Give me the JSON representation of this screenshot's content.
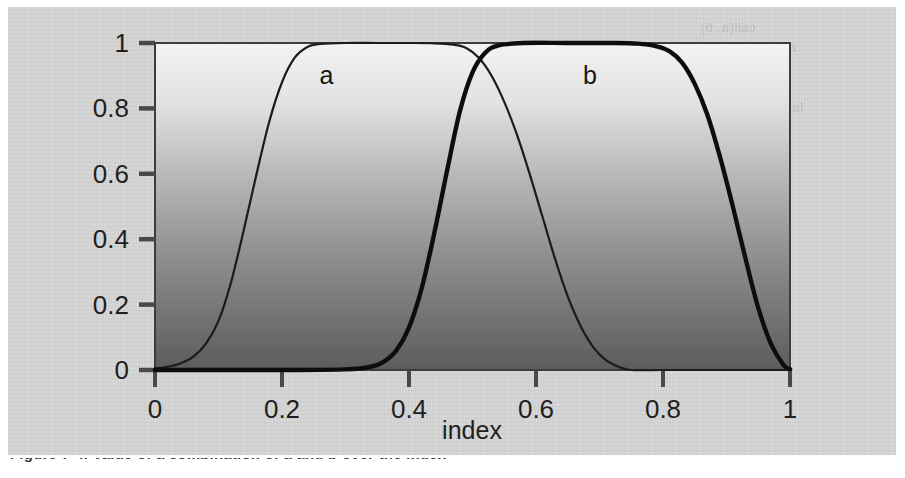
{
  "figure": {
    "caption": "Figure 7-4. Value of a combination of a and b over the index",
    "panel_background": "#d2d2d2",
    "page_background": "#ffffff"
  },
  "bleed_text": [
    {
      "text": "call(a, b)",
      "x": 700,
      "y": 20
    },
    {
      "text": "call(a, b, c) + f.p.  ind.",
      "x": 660,
      "y": 40
    },
    {
      "text": "func 4.2.5  ->  index  11.2.3.4",
      "x": 630,
      "y": 100
    },
    {
      "text": "f. 1 0.0",
      "x": 700,
      "y": 215
    },
    {
      "text": "def(a, b)",
      "x": 690,
      "y": 240
    },
    {
      "text": "for (v) { node ) C",
      "x": 650,
      "y": 300
    }
  ],
  "chart_data": {
    "type": "line",
    "title": "",
    "xlabel": "index",
    "ylabel": "",
    "xlim": [
      0,
      1
    ],
    "ylim": [
      0,
      1
    ],
    "grid": false,
    "legend_position": "inline-annotation",
    "xticks": [
      "0",
      "0.2",
      "0.4",
      "0.6",
      "0.8",
      "1"
    ],
    "xtick_values": [
      0,
      0.2,
      0.4,
      0.6,
      0.8,
      1
    ],
    "yticks": [
      "0",
      "0.2",
      "0.4",
      "0.6",
      "0.8",
      "1"
    ],
    "ytick_values": [
      0,
      0.2,
      0.4,
      0.6,
      0.8,
      1
    ],
    "annotations": [
      {
        "label": "a",
        "x": 0.27,
        "y": 0.9
      },
      {
        "label": "b",
        "x": 0.685,
        "y": 0.9
      }
    ],
    "series": [
      {
        "name": "a",
        "label": "a",
        "color": "#1a1a1a",
        "line_width": 2.2,
        "description": "smooth plateau rising from 0 near index 0.02 to 1 by index 0.24, holding 1 until index 0.47, then falling to 0 by index 0.74",
        "x": [
          0.0,
          0.02,
          0.04,
          0.06,
          0.08,
          0.1,
          0.12,
          0.14,
          0.16,
          0.18,
          0.2,
          0.22,
          0.24,
          0.26,
          0.3,
          0.35,
          0.4,
          0.44,
          0.47,
          0.49,
          0.51,
          0.53,
          0.55,
          0.57,
          0.59,
          0.61,
          0.63,
          0.65,
          0.67,
          0.69,
          0.71,
          0.73,
          0.75,
          0.8,
          0.9,
          1.0
        ],
        "y": [
          0.005,
          0.01,
          0.02,
          0.04,
          0.08,
          0.15,
          0.27,
          0.43,
          0.6,
          0.76,
          0.88,
          0.955,
          0.988,
          0.997,
          1.0,
          1.0,
          1.0,
          0.999,
          0.995,
          0.985,
          0.955,
          0.9,
          0.82,
          0.72,
          0.6,
          0.47,
          0.34,
          0.225,
          0.135,
          0.07,
          0.03,
          0.01,
          0.0,
          0.0,
          0.0,
          0.0
        ]
      },
      {
        "name": "b",
        "label": "b",
        "color": "#111111",
        "line_width": 4.4,
        "description": "smooth plateau rising from 0 near index 0.36 to 1 by index 0.52, holding 1 until index 0.79, then falling to 0 by index 1.0",
        "x": [
          0.0,
          0.1,
          0.2,
          0.3,
          0.34,
          0.36,
          0.38,
          0.4,
          0.42,
          0.44,
          0.46,
          0.48,
          0.5,
          0.52,
          0.54,
          0.58,
          0.65,
          0.72,
          0.76,
          0.79,
          0.81,
          0.83,
          0.85,
          0.87,
          0.89,
          0.91,
          0.93,
          0.95,
          0.97,
          0.99,
          1.0
        ],
        "y": [
          0.0,
          0.0,
          0.0,
          0.002,
          0.01,
          0.025,
          0.06,
          0.13,
          0.25,
          0.42,
          0.61,
          0.79,
          0.91,
          0.97,
          0.992,
          1.0,
          1.0,
          1.0,
          0.998,
          0.99,
          0.975,
          0.94,
          0.875,
          0.78,
          0.65,
          0.5,
          0.34,
          0.19,
          0.08,
          0.015,
          0.003
        ]
      }
    ]
  },
  "plot_geometry": {
    "frame_left": 147,
    "frame_top": 36,
    "frame_right": 782,
    "frame_bottom": 363,
    "frame_color": "#3c3c3c",
    "gradient_top": "#f2f2f2",
    "gradient_bottom": "#5e5e5e"
  }
}
